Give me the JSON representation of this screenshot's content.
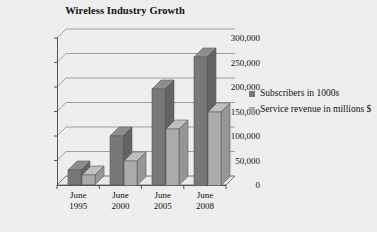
{
  "chart_data": {
    "type": "bar",
    "title": "Wireless Industry Growth",
    "xlabel": "",
    "ylabel": "",
    "ylim": [
      0,
      300000
    ],
    "ytick_labels": [
      "300,000",
      "250,000",
      "200,000",
      "150,000",
      "100,000",
      "50,000",
      "0"
    ],
    "ytick_values": [
      300000,
      250000,
      200000,
      150000,
      100000,
      50000,
      0
    ],
    "grid": true,
    "legend_position": "right",
    "style": "3d-column",
    "categories": [
      "June 1995",
      "June 2000",
      "June 2005",
      "June 2008"
    ],
    "category_lines": [
      [
        "June",
        "1995"
      ],
      [
        "June",
        "2000"
      ],
      [
        "June",
        "2005"
      ],
      [
        "June",
        "2008"
      ]
    ],
    "series": [
      {
        "name": "Subscribers in 1000s",
        "color": "#787878",
        "values": [
          30000,
          100000,
          195000,
          262000
        ]
      },
      {
        "name": "Service revenue in millions $",
        "color": "#ababab",
        "values": [
          20000,
          50000,
          115000,
          150000
        ]
      }
    ]
  },
  "legend": {
    "items": [
      {
        "label": "Subscribers in 1000s",
        "color": "#787878"
      },
      {
        "label": "Service revenue in millions $",
        "color": "#ababab"
      }
    ]
  },
  "colors": {
    "background": "#eeeeee",
    "axis": "#555555",
    "grid": "#8a8a8a",
    "series_1": "#787878",
    "series_1_top": "#8d8d8d",
    "series_1_side": "#636363",
    "series_2": "#ababab",
    "series_2_top": "#c0c0c0",
    "series_2_side": "#969696",
    "text": "#111111"
  }
}
